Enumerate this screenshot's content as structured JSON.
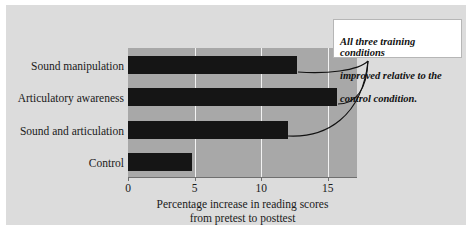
{
  "chart_data": {
    "type": "bar",
    "orientation": "horizontal",
    "title": "",
    "subtitle": "",
    "categories": [
      "Sound manipulation",
      "Articulatory awareness",
      "Sound and articulation",
      "Control"
    ],
    "values": [
      12.7,
      15.7,
      12.0,
      4.8
    ],
    "xlabel": "Percentage increase in reading scores from pretest to posttest",
    "xlabel_line1": "Percentage increase in reading scores",
    "xlabel_line2": "from pretest to posttest",
    "ylabel": "",
    "xlim": [
      0,
      17.2
    ],
    "ylim": [
      0,
      4
    ],
    "xticks": [
      0,
      5,
      10,
      15
    ],
    "xtick_labels": [
      "0",
      "5",
      "10",
      "15"
    ],
    "grid": true,
    "grid_axis": "x",
    "legend": false,
    "legend_position": "none",
    "annotations": [
      {
        "text": "All three training conditions improved relative to the control condition.",
        "text_line1": "All three training conditions",
        "text_line2": "improved relative to the",
        "text_line3": "control condition.",
        "style": "bold-italic",
        "points_to": [
          "Sound manipulation",
          "Articulatory awareness",
          "Sound and articulation"
        ]
      }
    ],
    "colors": {
      "bar": "#151515",
      "plot_background": "#a8a8a8",
      "figure_background": "#dcdcdc",
      "gridline": "#f2f2f2",
      "axis": "#6f6f6f",
      "annotation_background": "#ffffff",
      "annotation_border": "#b6b6b6",
      "text": "#1a1a1a",
      "page_background": "#ffffff"
    }
  }
}
